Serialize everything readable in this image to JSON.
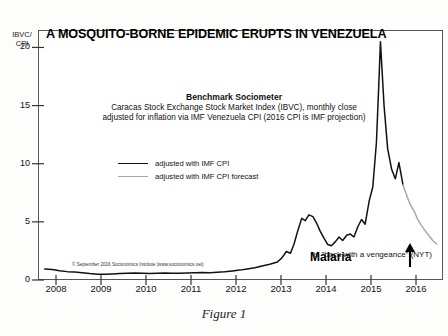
{
  "figure": {
    "caption": "Figure 1"
  },
  "chart_data": {
    "type": "line",
    "title": "A MOSQUITO-BORNE EPIDEMIC ERUPTS IN VENEZUELA",
    "subtitle_heading": "Benchmark Sociometer",
    "subtitle_line1": "Caracas Stock Exchange Stock Market Index (IBVC), monthly close",
    "subtitle_line2": "adjusted for inflation via IMF Venezuela CPI (2016 CPI is IMF projection)",
    "ylabel": "IBVC/\nCPI",
    "xlabel": "",
    "ylim": [
      0,
      21.5
    ],
    "xlim": [
      2007.6,
      2016.6
    ],
    "yticks": [
      0,
      5,
      10,
      15,
      20
    ],
    "ytick_labels": [
      "0",
      "5",
      "10",
      "15",
      "20"
    ],
    "xticks": [
      2008,
      2009,
      2010,
      2011,
      2012,
      2013,
      2014,
      2015,
      2016
    ],
    "xtick_labels": [
      "2008",
      "2009",
      "2010",
      "2011",
      "2012",
      "2013",
      "2014",
      "2015",
      "2016"
    ],
    "grid": false,
    "legend_position": "upper-center-left",
    "legend": [
      {
        "name": "adjusted with IMF CPI",
        "color": "#111111"
      },
      {
        "name": "adjusted with IMF CPI forecast",
        "color": "#a8a8a8"
      }
    ],
    "series": [
      {
        "name": "adjusted with IMF CPI",
        "color": "#111111",
        "x": [
          2007.75,
          2007.92,
          2008.08,
          2008.25,
          2008.42,
          2008.58,
          2008.75,
          2008.92,
          2009.08,
          2009.25,
          2009.42,
          2009.58,
          2009.75,
          2009.92,
          2010.08,
          2010.25,
          2010.42,
          2010.58,
          2010.75,
          2010.92,
          2011.08,
          2011.25,
          2011.42,
          2011.58,
          2011.75,
          2011.92,
          2012.08,
          2012.25,
          2012.42,
          2012.58,
          2012.75,
          2012.92,
          2013.02,
          2013.12,
          2013.21,
          2013.29,
          2013.37,
          2013.46,
          2013.54,
          2013.62,
          2013.71,
          2013.79,
          2013.87,
          2013.96,
          2014.04,
          2014.12,
          2014.21,
          2014.29,
          2014.37,
          2014.46,
          2014.54,
          2014.62,
          2014.71,
          2014.79,
          2014.87,
          2014.96,
          2015.04,
          2015.12,
          2015.17,
          2015.21,
          2015.29,
          2015.37,
          2015.46,
          2015.54,
          2015.62,
          2015.71
        ],
        "y": [
          0.95,
          0.9,
          0.8,
          0.72,
          0.68,
          0.62,
          0.55,
          0.5,
          0.5,
          0.52,
          0.55,
          0.58,
          0.6,
          0.58,
          0.56,
          0.58,
          0.6,
          0.58,
          0.57,
          0.6,
          0.62,
          0.65,
          0.63,
          0.66,
          0.7,
          0.78,
          0.85,
          0.95,
          1.05,
          1.2,
          1.35,
          1.55,
          1.9,
          2.45,
          2.3,
          3.1,
          4.2,
          5.3,
          5.1,
          5.6,
          5.45,
          4.9,
          4.2,
          3.55,
          3.05,
          2.95,
          3.3,
          3.7,
          3.4,
          3.85,
          3.95,
          3.7,
          4.6,
          5.2,
          4.8,
          6.8,
          8.0,
          11.8,
          16.5,
          20.5,
          15.0,
          11.3,
          9.5,
          8.7,
          10.1,
          8.2
        ]
      },
      {
        "name": "adjusted with IMF CPI forecast",
        "color": "#a8a8a8",
        "x": [
          2015.71,
          2015.79,
          2015.87,
          2015.96,
          2016.04,
          2016.12,
          2016.21,
          2016.29,
          2016.37,
          2016.46
        ],
        "y": [
          8.2,
          7.3,
          6.5,
          5.9,
          5.2,
          4.7,
          4.2,
          3.8,
          3.4,
          3.1
        ]
      }
    ],
    "annotations": [
      {
        "name": "malaria-label",
        "text": "Malaria"
      },
      {
        "name": "malaria-subtext",
        "text": "is \"back with a vengeance\" (NYT)"
      },
      {
        "name": "malaria-arrow",
        "text": "↑"
      },
      {
        "name": "copyright",
        "text": "© September 2016 Socionomics Institute (www.socionomics.net)"
      }
    ]
  }
}
